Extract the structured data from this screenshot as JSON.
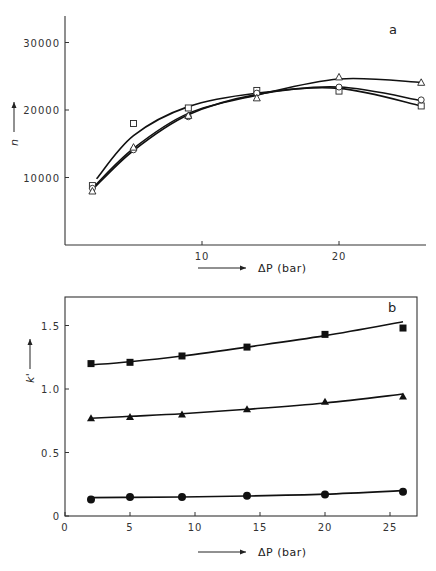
{
  "figure": {
    "panels": [
      "a",
      "b"
    ]
  },
  "chart_data": [
    {
      "type": "scatter",
      "panel_label": "a",
      "title": "",
      "xlabel": "ΔP (bar)",
      "ylabel": "n",
      "xlim": [
        0,
        26.5
      ],
      "ylim": [
        0,
        34000
      ],
      "xticks": [
        10,
        20
      ],
      "yticks": [
        10000,
        20000,
        30000
      ],
      "ytick_labels": [
        "10000",
        "20000",
        "30000"
      ],
      "xtick_labels": [
        "10",
        "20"
      ],
      "grid": false,
      "legend": null,
      "frame": "open-left-bottom",
      "x": [
        2,
        5,
        9,
        14,
        20,
        26
      ],
      "series": [
        {
          "name": "square (open)",
          "marker": "open-square",
          "values": [
            8800,
            18000,
            20300,
            22900,
            22800,
            20600
          ],
          "curve": [
            [
              2.3,
              9800
            ],
            [
              5,
              16200
            ],
            [
              9,
              20500
            ],
            [
              14,
              22500
            ],
            [
              20,
              23200
            ],
            [
              26,
              20600
            ]
          ]
        },
        {
          "name": "circle (open)",
          "marker": "open-circle",
          "values": [
            8400,
            14100,
            19000,
            22500,
            23400,
            21500
          ],
          "curve": [
            [
              2,
              8200
            ],
            [
              5,
              14000
            ],
            [
              9,
              19300
            ],
            [
              14,
              22300
            ],
            [
              20,
              23400
            ],
            [
              26,
              21400
            ]
          ]
        },
        {
          "name": "triangle (open)",
          "marker": "open-triangle",
          "values": [
            8000,
            14500,
            19200,
            21800,
            24900,
            24100
          ],
          "curve": [
            [
              2,
              8400
            ],
            [
              5,
              14300
            ],
            [
              9,
              19500
            ],
            [
              14,
              22200
            ],
            [
              20,
              24600
            ],
            [
              26,
              24100
            ]
          ]
        }
      ]
    },
    {
      "type": "scatter",
      "panel_label": "b",
      "title": "",
      "xlabel": "ΔP (bar)",
      "ylabel": "k'",
      "xlim": [
        0,
        27
      ],
      "ylim": [
        0,
        1.75
      ],
      "xticks": [
        0,
        5,
        10,
        15,
        20,
        25
      ],
      "xtick_labels": [
        "0",
        "5",
        "10",
        "15",
        "20",
        "25"
      ],
      "yticks": [
        0,
        0.5,
        1.0,
        1.5
      ],
      "ytick_labels": [
        "0",
        "0.5",
        "1.0",
        "1.5"
      ],
      "grid": false,
      "legend": null,
      "frame": "box",
      "x": [
        2,
        5,
        9,
        14,
        20,
        26
      ],
      "series": [
        {
          "name": "square (filled)",
          "marker": "filled-square",
          "values": [
            1.2,
            1.21,
            1.26,
            1.33,
            1.43,
            1.48
          ],
          "curve": [
            [
              2,
              1.19
            ],
            [
              5,
              1.215
            ],
            [
              9,
              1.26
            ],
            [
              14,
              1.33
            ],
            [
              20,
              1.42
            ],
            [
              26,
              1.53
            ]
          ]
        },
        {
          "name": "triangle (filled)",
          "marker": "filled-triangle",
          "values": [
            0.77,
            0.78,
            0.8,
            0.84,
            0.9,
            0.94
          ],
          "curve": [
            [
              2,
              0.77
            ],
            [
              5,
              0.785
            ],
            [
              9,
              0.805
            ],
            [
              14,
              0.84
            ],
            [
              20,
              0.89
            ],
            [
              26,
              0.96
            ]
          ]
        },
        {
          "name": "circle (filled)",
          "marker": "filled-circle",
          "values": [
            0.13,
            0.15,
            0.15,
            0.16,
            0.17,
            0.19
          ],
          "curve": [
            [
              2,
              0.145
            ],
            [
              5,
              0.147
            ],
            [
              9,
              0.15
            ],
            [
              14,
              0.157
            ],
            [
              20,
              0.172
            ],
            [
              26,
              0.2
            ]
          ]
        }
      ]
    }
  ],
  "layout_px": {
    "a": {
      "x0": 65,
      "x_per_unit": 13.7,
      "y0": 245,
      "y_per_unit": 0.00675,
      "right": 436,
      "top": 16
    },
    "b": {
      "x0": 65,
      "x_per_unit": 13.0,
      "y0": 516,
      "y_per_unit": 127,
      "right": 417,
      "top": 297
    }
  }
}
